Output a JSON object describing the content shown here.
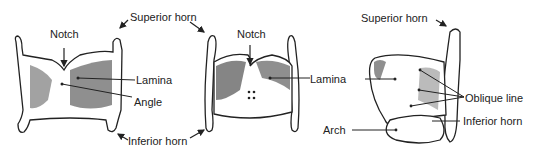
{
  "diagram": {
    "views": [
      {
        "name": "anterior",
        "labels": [
          "Notch",
          "Lamina",
          "Angle"
        ]
      },
      {
        "name": "posterior",
        "labels": [
          "Notch",
          "Lamina"
        ]
      },
      {
        "name": "lateral",
        "labels": [
          "Superior horn",
          "Lamina",
          "Oblique line",
          "Inferior horn",
          "Arch"
        ]
      }
    ],
    "shared_labels": [
      "Superior horn",
      "Inferior horn"
    ]
  },
  "labels": {
    "notch_front": "Notch",
    "superior_horn_shared": "Superior horn",
    "lamina_front": "Lamina",
    "angle": "Angle",
    "inferior_horn_shared": "Inferior horn",
    "notch_back": "Notch",
    "lamina_shared": "Lamina",
    "superior_horn_side": "Superior horn",
    "oblique_line": "Oblique line",
    "inferior_horn_side": "Inferior horn",
    "arch": "Arch"
  }
}
